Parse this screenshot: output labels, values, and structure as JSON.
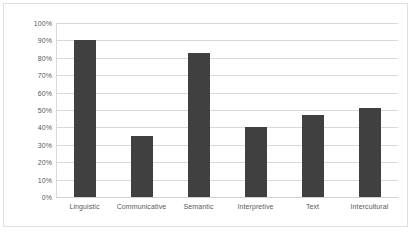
{
  "chart_data": {
    "type": "bar",
    "title": "",
    "subtitle": "",
    "xlabel": "",
    "ylabel": "",
    "categories": [
      "Linguistic",
      "Communicative",
      "Semantic",
      "Interpretive",
      "Text",
      "Intercultural"
    ],
    "values": [
      90,
      35,
      83,
      40,
      47,
      51
    ],
    "ylim": [
      0,
      100
    ],
    "ytick_labels": [
      "100%",
      "90%",
      "80%",
      "70%",
      "60%",
      "50%",
      "40%",
      "30%",
      "20%",
      "10%",
      "0%"
    ],
    "ytick_values": [
      100,
      90,
      80,
      70,
      60,
      50,
      40,
      30,
      20,
      10,
      0
    ],
    "grid": true,
    "legend": false,
    "legend_position": "none",
    "series": [
      {
        "name": "Series 1",
        "values": [
          90,
          35,
          83,
          40,
          47,
          51
        ],
        "color": "#404040"
      }
    ],
    "colors": {
      "bar": "#404040",
      "gridline": "#d9d9d9",
      "axis": "#d9d9d9",
      "tick_text": "#595959",
      "plot_background": "#ffffff",
      "frame_border": "#dfdfdf"
    }
  }
}
